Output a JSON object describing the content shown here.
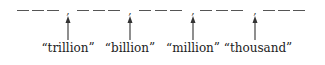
{
  "diagram": {
    "groups": [
      {
        "dashes": 3,
        "positions": [
          17,
          32,
          47
        ]
      },
      {
        "dashes": 3,
        "positions": [
          77,
          93,
          108
        ]
      },
      {
        "dashes": 3,
        "positions": [
          139,
          155,
          170
        ]
      },
      {
        "dashes": 3,
        "positions": [
          200,
          216,
          231
        ]
      },
      {
        "dashes": 3,
        "positions": [
          263,
          278,
          293
        ]
      }
    ],
    "separator_glyph": ",",
    "separators": [
      {
        "x": 68,
        "label": "“trillion”"
      },
      {
        "x": 130,
        "label": "“billion”"
      },
      {
        "x": 193,
        "label": "“million”"
      },
      {
        "x": 255,
        "label": "“thousand”"
      }
    ],
    "colors": {
      "line": "#555555",
      "text": "#222222",
      "background": "#ffffff"
    }
  }
}
